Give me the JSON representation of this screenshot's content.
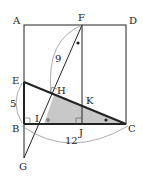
{
  "diagram": {
    "type": "geometry",
    "points": {
      "A": {
        "label": "A",
        "x": 24,
        "y": 25
      },
      "F": {
        "label": "F",
        "x": 82,
        "y": 25
      },
      "D": {
        "label": "D",
        "x": 126,
        "y": 25
      },
      "E": {
        "label": "E",
        "x": 24,
        "y": 82
      },
      "H": {
        "label": "H",
        "x": 54,
        "y": 95
      },
      "K": {
        "label": "K",
        "x": 82,
        "y": 105
      },
      "B": {
        "label": "B",
        "x": 24,
        "y": 124
      },
      "I": {
        "label": "I",
        "x": 40,
        "y": 124
      },
      "J": {
        "label": "J",
        "x": 82,
        "y": 124
      },
      "C": {
        "label": "C",
        "x": 126,
        "y": 124
      },
      "G": {
        "label": "G",
        "x": 24,
        "y": 158
      }
    },
    "measurements": {
      "FH": "9",
      "EB": "5",
      "BC": "12"
    },
    "colors": {
      "line": "#222222",
      "shade": "#c8c8c8",
      "arc": "#888888"
    }
  }
}
